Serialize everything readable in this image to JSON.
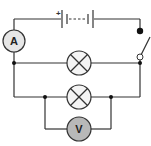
{
  "diagram": {
    "type": "electric-circuit",
    "colors": {
      "wire": "#333333",
      "meter_fill_ammeter": "#e6e6e6",
      "meter_fill_voltmeter": "#b8b8b8",
      "lamp_fill": "#f4f4f4"
    },
    "battery": {
      "polarity_label": "+"
    },
    "ammeter": {
      "label": "A"
    },
    "voltmeter": {
      "label": "V"
    },
    "lamps": [
      {
        "id": "lamp-1"
      },
      {
        "id": "lamp-2"
      }
    ],
    "switch": {
      "state": "open"
    }
  }
}
